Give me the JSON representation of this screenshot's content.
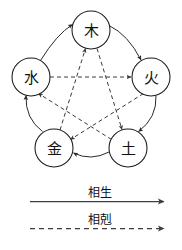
{
  "diagram": {
    "nodes": [
      {
        "id": "wood",
        "label": "木",
        "cx": 91,
        "cy": 30,
        "r": 19
      },
      {
        "id": "fire",
        "label": "火",
        "cx": 151,
        "cy": 77,
        "r": 19
      },
      {
        "id": "earth",
        "label": "土",
        "cx": 128,
        "cy": 148,
        "r": 19
      },
      {
        "id": "metal",
        "label": "金",
        "cx": 54,
        "cy": 148,
        "r": 19
      },
      {
        "id": "water",
        "label": "水",
        "cx": 31,
        "cy": 77,
        "r": 19
      }
    ],
    "generation_cycle": {
      "name": "相生",
      "style": "solid",
      "edges": [
        {
          "from": "water",
          "to": "wood"
        },
        {
          "from": "wood",
          "to": "fire"
        },
        {
          "from": "fire",
          "to": "earth"
        },
        {
          "from": "earth",
          "to": "metal"
        },
        {
          "from": "metal",
          "to": "water"
        }
      ]
    },
    "overcoming_cycle": {
      "name": "相剋",
      "style": "dashed",
      "edges": [
        {
          "from": "water",
          "to": "fire"
        },
        {
          "from": "fire",
          "to": "metal"
        },
        {
          "from": "metal",
          "to": "wood"
        },
        {
          "from": "wood",
          "to": "earth"
        },
        {
          "from": "earth",
          "to": "water"
        }
      ]
    },
    "colors": {
      "stroke": "#1a1a1a",
      "arc": "#2b2b2b",
      "dashed": "#3a3a3a",
      "legend": "#3d3d4a",
      "background": "#ffffff"
    }
  },
  "legend": {
    "generation_label": "相生",
    "overcoming_label": "相剋"
  }
}
